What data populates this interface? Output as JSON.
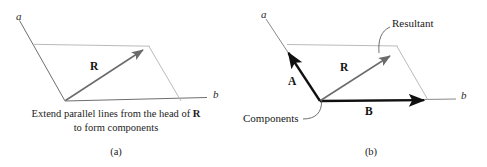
{
  "figure": {
    "colors": {
      "resultant_vector": "#6b6b6b",
      "component_vector": "#101010",
      "construction_line": "#a8a8a8",
      "axis_line": "#3a3a3a",
      "text": "#1a1a1a",
      "background": "#ffffff"
    },
    "panels": [
      {
        "tag": "(a)",
        "axis_a_label": "a",
        "axis_b_label": "b",
        "resultant_label": "R",
        "caption_line_1_prefix": "Extend parallel lines from the head of ",
        "caption_line_1_vector": "R",
        "caption_line_2": "to form components"
      },
      {
        "tag": "(b)",
        "axis_a_label": "a",
        "axis_b_label": "b",
        "resultant_label": "R",
        "component_a_label": "A",
        "component_b_label": "B",
        "callout_resultant": "Resultant",
        "callout_components": "Components"
      }
    ]
  }
}
